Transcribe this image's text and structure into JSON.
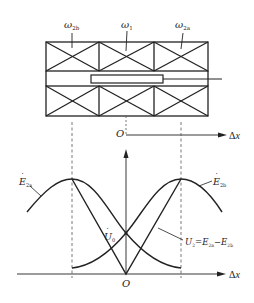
{
  "figure": {
    "type": "LVDT (differential transformer) structure and output characteristic",
    "top_section": {
      "coil_labels": [
        {
          "symbol": "ω",
          "sub": "2b",
          "text": "ω2b"
        },
        {
          "symbol": "ω",
          "sub": "1",
          "text": "ω1"
        },
        {
          "symbol": "ω",
          "sub": "2a",
          "text": "ω2a"
        }
      ],
      "origin_label": "O",
      "axis_label": "Δx"
    },
    "bottom_section": {
      "curve_labels": {
        "e2a": {
          "main": "E",
          "sub": "2a",
          "text": "Ė2a"
        },
        "e2b": {
          "main": "E",
          "sub": "2b",
          "text": "Ė2b"
        },
        "u0": {
          "main": "U",
          "sub": "0",
          "text": "U̇0"
        },
        "u2": {
          "text": "U̇2=Ė2a−Ė2b",
          "parts": [
            "U",
            "2",
            "=",
            "E",
            "2a",
            "−",
            "E",
            "2b"
          ]
        }
      },
      "origin_label": "O",
      "axis_label": "Δx"
    },
    "colors": {
      "line": "#222222",
      "dash": "#555555",
      "background": "#ffffff"
    }
  }
}
